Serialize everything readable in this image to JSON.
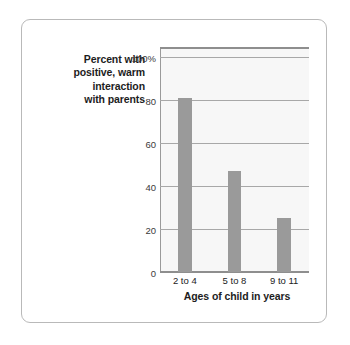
{
  "chart_data": {
    "type": "bar",
    "title": "",
    "subtitle": "",
    "categories": [
      "2 to 4",
      "5 to 8",
      "9 to 11"
    ],
    "values": [
      81,
      47,
      25
    ],
    "xlabel": "Ages of child in years",
    "ylabel": "Percent with positive, warm interaction with parents",
    "ylabel_lines": [
      "Percent with",
      "positive, warm",
      "interaction",
      "with parents"
    ],
    "ytick_labels": [
      "100%",
      "80",
      "60",
      "40",
      "20",
      "0"
    ],
    "ytick_values": [
      100,
      80,
      60,
      40,
      20,
      0
    ],
    "ylim": [
      0,
      105
    ],
    "xlim_categories": 3,
    "grid": true,
    "grid_axis": "y",
    "legend": "none",
    "annotations": [],
    "colors": {
      "bar": "#9a9a9a",
      "plot_background": "#f7f7f7",
      "gridline": "#a8a8a8",
      "axis_line": "#8e8e8e",
      "frame_border": "#b9b9b9",
      "text": "#1d1d1d",
      "page_background": "#ffffff"
    }
  }
}
